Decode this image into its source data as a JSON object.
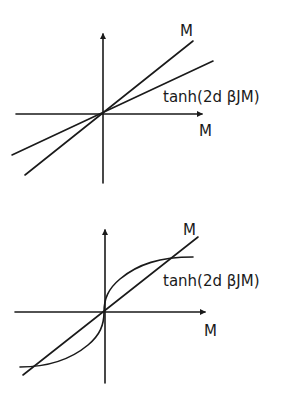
{
  "diagrams": [
    {
      "id": "subcritical",
      "description": "Line M and tanh(2d βJM) intersect only at origin",
      "labels": {
        "line": "M",
        "curve": "tanh(2d βJM)",
        "x_axis": "M"
      }
    },
    {
      "id": "supercritical",
      "description": "Line M and tanh(2d βJM) curve intersect at origin and two symmetric nonzero points",
      "labels": {
        "line": "M",
        "curve": "tanh(2d βJM)",
        "x_axis": "M"
      }
    }
  ],
  "colors": {
    "stroke": "#1a1a1a",
    "background": "#ffffff"
  }
}
